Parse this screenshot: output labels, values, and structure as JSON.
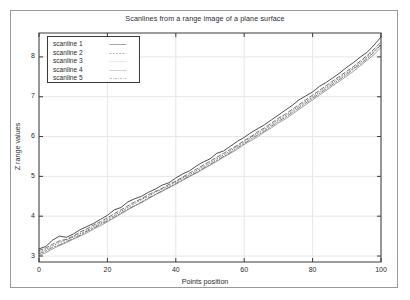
{
  "figure": {
    "title": "Scanlines from a range image of a plane surface",
    "background_color": "#ffffff",
    "frame_color": "#9a9a9a",
    "axis_color": "#3a3a3a",
    "grid_color": "#e6e6e6"
  },
  "axes": {
    "xlabel": "Points position",
    "ylabel": "Z range values",
    "xticks": [
      "0",
      "20",
      "40",
      "60",
      "80",
      "100"
    ],
    "yticks": [
      "3",
      "4",
      "5",
      "6",
      "7",
      "8"
    ]
  },
  "legend": {
    "position": "top-left-inside",
    "entries": [
      {
        "label": "scanline 1",
        "style": "solid"
      },
      {
        "label": "scanline 2",
        "style": "dashed"
      },
      {
        "label": "scanline 3",
        "style": "dotted"
      },
      {
        "label": "scanline 4",
        "style": "solid-thin"
      },
      {
        "label": "scanline 5",
        "style": "dash-dot"
      }
    ]
  },
  "chart_data": {
    "type": "line",
    "title": "Scanlines from a range image of a plane surface",
    "xlabel": "Points position",
    "ylabel": "Z range values",
    "xlim": [
      0,
      100
    ],
    "ylim": [
      2.85,
      8.6
    ],
    "xticks": [
      0,
      20,
      40,
      60,
      80,
      100
    ],
    "yticks": [
      3,
      4,
      5,
      6,
      7,
      8
    ],
    "grid": true,
    "legend_position": "upper left",
    "x": [
      0,
      2,
      4,
      6,
      8,
      10,
      12,
      14,
      16,
      18,
      20,
      22,
      24,
      26,
      28,
      30,
      32,
      34,
      36,
      38,
      40,
      42,
      44,
      46,
      48,
      50,
      52,
      54,
      56,
      58,
      60,
      62,
      64,
      66,
      68,
      70,
      72,
      74,
      76,
      78,
      80,
      82,
      84,
      86,
      88,
      90,
      92,
      94,
      96,
      98,
      100
    ],
    "series": [
      {
        "name": "scanline 1",
        "style": "solid",
        "color": "#444444",
        "values": [
          3.18,
          3.24,
          3.4,
          3.5,
          3.47,
          3.55,
          3.66,
          3.74,
          3.82,
          3.92,
          4.02,
          4.16,
          4.22,
          4.36,
          4.44,
          4.5,
          4.6,
          4.68,
          4.78,
          4.84,
          4.96,
          5.06,
          5.14,
          5.26,
          5.36,
          5.44,
          5.58,
          5.64,
          5.76,
          5.88,
          5.98,
          6.1,
          6.2,
          6.3,
          6.42,
          6.54,
          6.66,
          6.78,
          6.92,
          7.02,
          7.12,
          7.26,
          7.36,
          7.48,
          7.6,
          7.74,
          7.86,
          8.0,
          8.12,
          8.3,
          8.5
        ]
      },
      {
        "name": "scanline 2",
        "style": "dashed",
        "color": "#444444",
        "values": [
          3.14,
          3.2,
          3.3,
          3.38,
          3.42,
          3.5,
          3.6,
          3.68,
          3.78,
          3.86,
          3.96,
          4.06,
          4.16,
          4.26,
          4.36,
          4.44,
          4.54,
          4.62,
          4.7,
          4.8,
          4.88,
          4.98,
          5.08,
          5.18,
          5.28,
          5.38,
          5.48,
          5.58,
          5.68,
          5.78,
          5.9,
          6.0,
          6.12,
          6.22,
          6.34,
          6.46,
          6.56,
          6.68,
          6.8,
          6.92,
          7.04,
          7.16,
          7.28,
          7.4,
          7.52,
          7.64,
          7.76,
          7.9,
          8.04,
          8.2,
          8.38
        ]
      },
      {
        "name": "scanline 3",
        "style": "dotted",
        "color": "#555555",
        "values": [
          3.1,
          3.16,
          3.26,
          3.34,
          3.4,
          3.48,
          3.56,
          3.64,
          3.74,
          3.82,
          3.92,
          4.02,
          4.12,
          4.22,
          4.32,
          4.42,
          4.5,
          4.6,
          4.68,
          4.76,
          4.86,
          4.96,
          5.04,
          5.14,
          5.24,
          5.34,
          5.44,
          5.54,
          5.64,
          5.76,
          5.86,
          5.98,
          6.08,
          6.18,
          6.3,
          6.42,
          6.52,
          6.64,
          6.76,
          6.88,
          7.0,
          7.12,
          7.24,
          7.36,
          7.48,
          7.6,
          7.72,
          7.86,
          8.0,
          8.16,
          8.32
        ]
      },
      {
        "name": "scanline 4",
        "style": "solid-thin",
        "color": "#777777",
        "values": [
          3.02,
          3.08,
          3.18,
          3.26,
          3.34,
          3.42,
          3.5,
          3.58,
          3.68,
          3.76,
          3.86,
          3.96,
          4.06,
          4.16,
          4.26,
          4.34,
          4.44,
          4.54,
          4.62,
          4.72,
          4.8,
          4.9,
          5.0,
          5.08,
          5.18,
          5.28,
          5.38,
          5.48,
          5.58,
          5.68,
          5.8,
          5.9,
          6.0,
          6.12,
          6.22,
          6.34,
          6.44,
          6.56,
          6.68,
          6.8,
          6.92,
          7.04,
          7.16,
          7.28,
          7.4,
          7.52,
          7.64,
          7.78,
          7.92,
          8.06,
          8.24
        ]
      },
      {
        "name": "scanline 5",
        "style": "dash-dot",
        "color": "#555555",
        "values": [
          3.06,
          3.12,
          3.22,
          3.28,
          3.36,
          3.44,
          3.52,
          3.62,
          3.7,
          3.8,
          3.88,
          3.98,
          4.08,
          4.18,
          4.26,
          4.36,
          4.46,
          4.54,
          4.64,
          4.72,
          4.82,
          4.92,
          5.0,
          5.1,
          5.2,
          5.3,
          5.4,
          5.5,
          5.6,
          5.72,
          5.82,
          5.94,
          6.04,
          6.14,
          6.26,
          6.38,
          6.48,
          6.6,
          6.72,
          6.84,
          6.96,
          7.08,
          7.2,
          7.32,
          7.44,
          7.56,
          7.7,
          7.82,
          7.96,
          8.12,
          8.3
        ]
      }
    ]
  }
}
